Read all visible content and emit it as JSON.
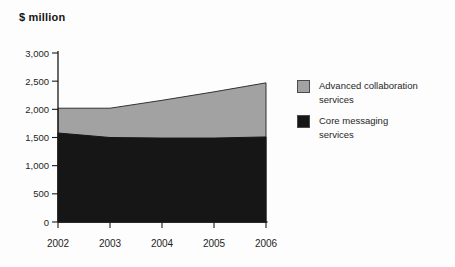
{
  "chart_data": {
    "type": "area",
    "stacked": true,
    "title": "",
    "xlabel": "",
    "ylabel": "$ million",
    "categories": [
      "2002",
      "2003",
      "2004",
      "2005",
      "2006"
    ],
    "series": [
      {
        "name": "Core messaging services",
        "color": "#161616",
        "values": [
          1580,
          1500,
          1490,
          1490,
          1510
        ]
      },
      {
        "name": "Advanced collaboration services",
        "color": "#a2a2a2",
        "values": [
          440,
          520,
          670,
          820,
          960
        ]
      }
    ],
    "totals": [
      2020,
      2020,
      2160,
      2310,
      2470
    ],
    "ylim": [
      0,
      3000
    ],
    "y_ticks": [
      0,
      500,
      1000,
      1500,
      2000,
      2500,
      3000
    ],
    "y_tick_labels": [
      "0",
      "500",
      "1,000",
      "1,500",
      "2,000",
      "2,500",
      "3,000"
    ],
    "grid": false,
    "legend_position": "right",
    "axis_color": "#1a1a1a",
    "text_color": "#1f1f1f",
    "outline_color": "#333333"
  },
  "legend": {
    "items": [
      {
        "label": "Advanced collaboration services",
        "color": "#a2a2a2"
      },
      {
        "label": "Core messaging services",
        "color": "#161616"
      }
    ]
  }
}
